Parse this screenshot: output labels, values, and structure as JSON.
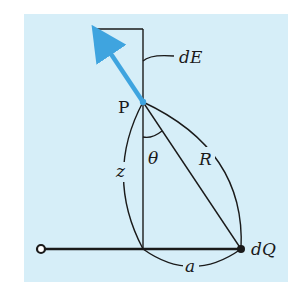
{
  "figure": {
    "background_color": "#d6eef8",
    "line_color": "#1a1a1a",
    "arrow_color": "#3fa4df",
    "labels": {
      "field": "dE",
      "point": "P",
      "angle": "θ",
      "distance_z": "z",
      "distance_r": "R",
      "distance_a": "a",
      "charge": "dQ"
    }
  }
}
